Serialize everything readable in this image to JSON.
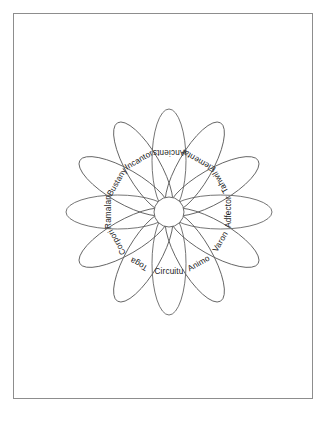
{
  "page": {
    "background_color": "#ffffff",
    "sheet_border_color": "#8d8d8d",
    "footer_mark": ""
  },
  "diagram": {
    "title": "",
    "type": "radial-petal-diagram",
    "petal_count": 12,
    "center": {
      "x": 169,
      "y": 212
    },
    "hub_radius": 15,
    "petal_length": 103,
    "petal_half_width": 17,
    "stroke_color": "#5c5c5c",
    "label_color": "#1a1a1a",
    "petals": [
      {
        "label": "Ancients",
        "angle_deg": 0,
        "text_flipped": false
      },
      {
        "label": "Elemental",
        "angle_deg": 30,
        "text_flipped": false
      },
      {
        "label": "Tahwil",
        "angle_deg": 60,
        "text_flipped": false
      },
      {
        "label": "Adfector",
        "angle_deg": 90,
        "text_flipped": false
      },
      {
        "label": "Varon",
        "angle_deg": 120,
        "text_flipped": false
      },
      {
        "label": "Animo",
        "angle_deg": 150,
        "text_flipped": false
      },
      {
        "label": "Circuitu",
        "angle_deg": 180,
        "text_flipped": false
      },
      {
        "label": "Toga",
        "angle_deg": 210,
        "text_flipped": true
      },
      {
        "label": "Corpori",
        "angle_deg": 240,
        "text_flipped": true
      },
      {
        "label": "Ramalan",
        "angle_deg": 270,
        "text_flipped": true
      },
      {
        "label": "Bustany",
        "angle_deg": 300,
        "text_flipped": true
      },
      {
        "label": "Incantor",
        "angle_deg": 330,
        "text_flipped": true
      }
    ]
  }
}
